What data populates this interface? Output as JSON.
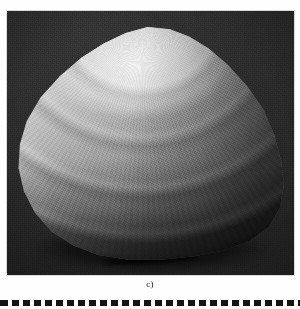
{
  "figure": {
    "caption": "c)",
    "photo": {
      "alt_text": "Grayscale photograph of a triangular bivalve (clam) shell with concentric growth rings, lit from upper left on a dark background",
      "background_color": "#2a2a2a",
      "shell_highlight_color": "#f2f2f2",
      "shell_midtone_color": "#b4b4b4",
      "shell_shadow_color": "#3a3a3a",
      "growth_ring_count": 9,
      "umbo_position": "top-center"
    }
  },
  "separator": {
    "style": "dashed",
    "color": "#141414",
    "dash_length_px": 7,
    "gap_length_px": 4
  }
}
